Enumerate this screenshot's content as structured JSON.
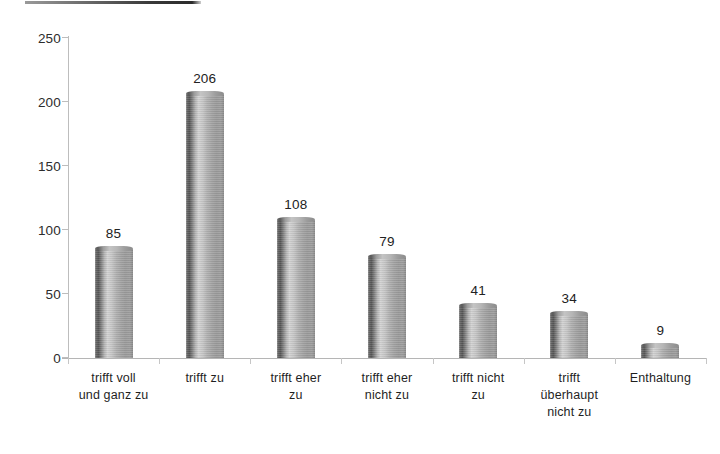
{
  "chart_data": {
    "type": "bar",
    "title": "",
    "subtitle": "",
    "xlabel": "",
    "ylabel": "",
    "ylim": [
      0,
      250
    ],
    "ytick_labels": [
      "250",
      "200",
      "150",
      "100",
      "50",
      "0"
    ],
    "ytick_values": [
      250,
      200,
      150,
      100,
      50,
      0
    ],
    "grid": false,
    "legend": false,
    "legend_position": "none",
    "categories": [
      "trifft voll und ganz zu",
      "trifft zu",
      "trifft eher zu",
      "trifft eher nicht zu",
      "trifft nicht zu",
      "trifft überhaupt nicht zu",
      "Enthaltung"
    ],
    "category_lines": [
      [
        "trifft voll",
        "und ganz  zu"
      ],
      [
        "trifft zu"
      ],
      [
        "trifft eher",
        "zu"
      ],
      [
        "trifft eher",
        "nicht zu"
      ],
      [
        "trifft nicht",
        "zu"
      ],
      [
        "trifft",
        "überhaupt",
        "nicht zu"
      ],
      [
        "Enthaltung"
      ]
    ],
    "values": [
      85,
      206,
      108,
      79,
      41,
      34,
      9
    ],
    "data_labels": [
      "85",
      "206",
      "108",
      "79",
      "41",
      "34",
      "9"
    ],
    "series": [
      {
        "name": "",
        "values": [
          85,
          206,
          108,
          79,
          41,
          34,
          9
        ]
      }
    ],
    "bar_style": "3d-cylinder",
    "colors": {
      "bar_dark": "#565656",
      "bar_mid": "#a3a3a3",
      "bar_light": "#d2d2d2",
      "axis": "#bdbdbd",
      "text": "#1f1f1f",
      "background": "#ffffff",
      "title_rule": "#2b2b2b"
    }
  }
}
